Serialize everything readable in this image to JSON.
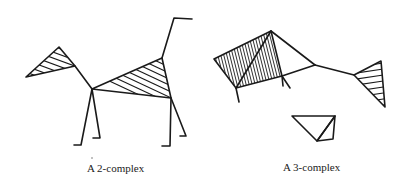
{
  "figures": [
    {
      "caption": "A 2-complex",
      "description": "Animal-shaped simplicial 2-complex: hatched head triangle, hatched body triangle, line-segment neck, legs and tail"
    },
    {
      "caption": "A 3-complex",
      "description": "Simplicial 3-complex: densely hatched tetrahedron joined by edges to a hatched triangle, plus a separate unshaded pair of triangles"
    }
  ],
  "colors": {
    "ink": "#1a1a1a",
    "background": "#ffffff"
  }
}
